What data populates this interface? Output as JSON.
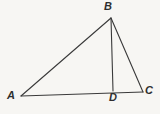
{
  "figure": {
    "background_color": "#f7f6f3",
    "stroke_color": "#3a3a3a",
    "label_color": "#2e2e2e",
    "stroke_width": 1.1,
    "canvas": {
      "width": 160,
      "height": 114
    },
    "points": {
      "A": {
        "x": 21,
        "y": 96,
        "label": "A"
      },
      "B": {
        "x": 111,
        "y": 18,
        "label": "B"
      },
      "C": {
        "x": 143,
        "y": 92,
        "label": "C"
      },
      "D": {
        "x": 113,
        "y": 91,
        "label": "D"
      }
    },
    "segments": [
      {
        "name": "segment-AB",
        "from": "A",
        "to": "B"
      },
      {
        "name": "segment-BC",
        "from": "B",
        "to": "C"
      },
      {
        "name": "segment-AC",
        "from": "A",
        "to": "C"
      },
      {
        "name": "segment-BD",
        "from": "B",
        "to": "D"
      }
    ],
    "labels": {
      "A": "A",
      "B": "B",
      "C": "C",
      "D": "D"
    }
  }
}
